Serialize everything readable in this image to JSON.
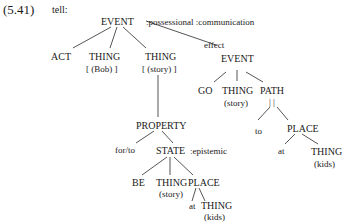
{
  "example": {
    "number": "(5.41)",
    "verb": "tell:"
  },
  "nodes": {
    "root": {
      "label": "EVENT",
      "features": ":possessional  :communication"
    },
    "act": {
      "label": "ACT"
    },
    "thing_bob": {
      "label": "THING",
      "content": "[ (Bob) ]"
    },
    "thing_story": {
      "label": "THING",
      "content": "[ (story) ]"
    },
    "effect_label": "effect",
    "event2": {
      "label": "EVENT"
    },
    "go": {
      "label": "GO"
    },
    "thing_story2": {
      "label": "THING",
      "content": "(story)"
    },
    "path": {
      "label": "PATH",
      "content": "| |"
    },
    "to": {
      "label": "to"
    },
    "place": {
      "label": "PLACE"
    },
    "at": {
      "label": "at"
    },
    "thing_kids": {
      "label": "THING",
      "content": "(kids)"
    },
    "property": {
      "label": "PROPERTY"
    },
    "for_to": {
      "label": "for/to"
    },
    "state": {
      "label": "STATE",
      "features": ":epistemic"
    },
    "be": {
      "label": "BE"
    },
    "thing_story3": {
      "label": "THING",
      "content": "(story)"
    },
    "place2": {
      "label": "PLACE"
    },
    "at2": {
      "label": "at"
    },
    "thing_kids2": {
      "label": "THING",
      "content": "(kids)"
    }
  }
}
